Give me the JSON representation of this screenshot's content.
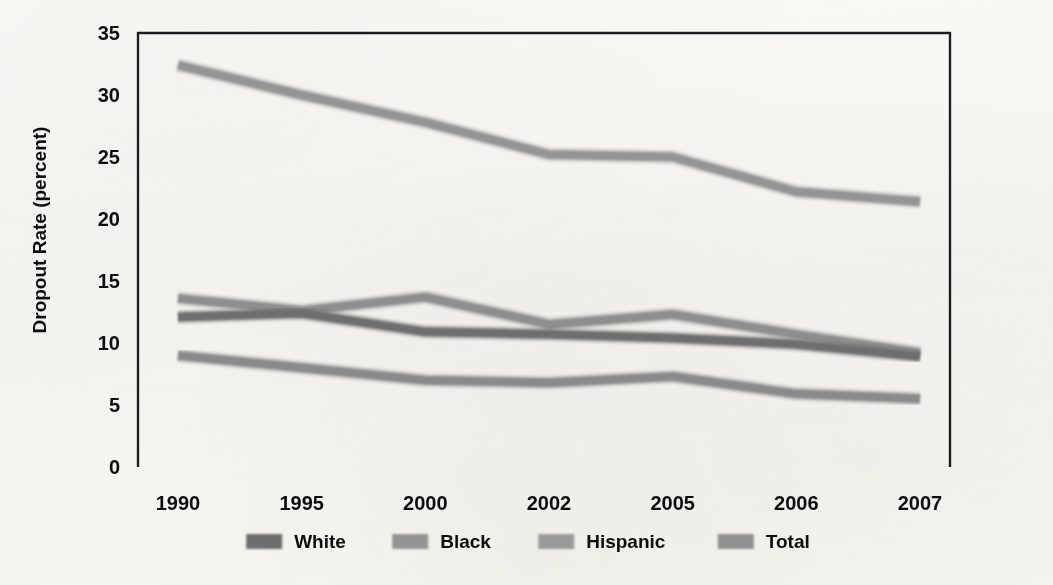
{
  "chart_data": {
    "type": "line",
    "title": "",
    "xlabel": "",
    "ylabel": "Dropout Rate (percent)",
    "categories": [
      "1990",
      "1995",
      "2000",
      "2002",
      "2005",
      "2006",
      "2007"
    ],
    "ylim": [
      0,
      35
    ],
    "ytick_step": 5,
    "yticks": [
      "0",
      "5",
      "10",
      "15",
      "20",
      "25",
      "30",
      "35"
    ],
    "grid": "horizontal-dotted",
    "legend_position": "bottom",
    "series": [
      {
        "name": "White",
        "color": "#6e6e6e",
        "values": [
          12.1,
          12.4,
          10.9,
          10.7,
          10.4,
          9.9,
          8.9
        ]
      },
      {
        "name": "Black",
        "color": "#8e8e8e",
        "values": [
          13.6,
          12.6,
          13.7,
          11.5,
          12.3,
          10.7,
          9.2
        ]
      },
      {
        "name": "Hispanic",
        "color": "#949494",
        "values": [
          32.4,
          30.0,
          27.8,
          25.2,
          25.0,
          22.2,
          21.4
        ]
      },
      {
        "name": "Total",
        "color": "#8a8a8a",
        "values": [
          9.0,
          8.0,
          7.0,
          6.8,
          7.3,
          5.9,
          5.5
        ]
      }
    ]
  },
  "axis": {
    "y_label": "Dropout Rate (percent)"
  },
  "legend": {
    "items": [
      {
        "label": "White",
        "swatch": "#6e6e6e"
      },
      {
        "label": "Black",
        "swatch": "#949494"
      },
      {
        "label": "Hispanic",
        "swatch": "#9a9a9a"
      },
      {
        "label": "Total",
        "swatch": "#909090"
      }
    ]
  },
  "style": {
    "plot_border_color": "#1a1a1a",
    "gridline_color": "#2a2a2a",
    "background": "#f7f6f2",
    "line_width": 9
  }
}
